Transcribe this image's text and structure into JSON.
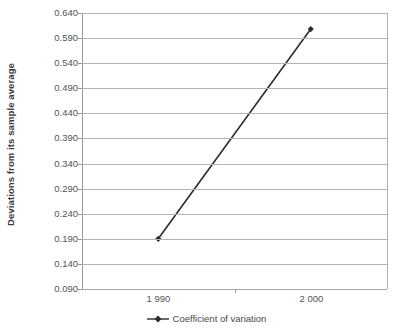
{
  "chart_data": {
    "type": "line",
    "title": "",
    "xlabel": "",
    "ylabel": "Deviations from its sample average",
    "categories": [
      "1 990",
      "2 000"
    ],
    "x": [
      1990,
      2000
    ],
    "series": [
      {
        "name": "Coefficient of variation",
        "values": [
          0.19,
          0.608
        ],
        "color": "#2b2b2b",
        "marker": "diamond"
      }
    ],
    "ylim": [
      0.09,
      0.64
    ],
    "yticks": [
      0.09,
      0.14,
      0.19,
      0.24,
      0.29,
      0.34,
      0.39,
      0.44,
      0.49,
      0.54,
      0.59,
      0.64
    ],
    "ytick_labels": [
      "0.090",
      "0.140",
      "0.190",
      "0.240",
      "0.290",
      "0.340",
      "0.390",
      "0.440",
      "0.490",
      "0.540",
      "0.590",
      "0.640"
    ],
    "grid": true,
    "grid_axis": "y",
    "legend_position": "bottom",
    "colors": {
      "series_line": "#2b2b2b",
      "gridline": "#b4b4b4",
      "axis": "#9a9a9a",
      "text": "#545454",
      "axis_title": "#3b3b3b",
      "background": "#ffffff"
    }
  },
  "legend": {
    "items": [
      {
        "label": "Coefficient of variation",
        "marker_icon": "diamond-marker-icon"
      }
    ]
  }
}
